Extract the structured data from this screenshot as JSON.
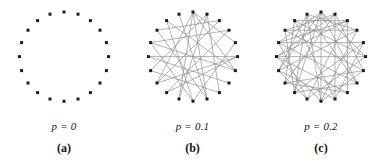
{
  "figure": {
    "type": "network-graph-series",
    "background_color": "#ffffff",
    "node_color": "#1c1c1c",
    "edge_color": "#8a8a8a"
  },
  "chart_data": {
    "type": "scatter",
    "title": "",
    "xlabel": "",
    "ylabel": "",
    "grid": false,
    "legend": null,
    "panels": [
      {
        "id": "a",
        "letter": "(a)",
        "param_label": "p = 0",
        "p_value": 0,
        "node_count": 20,
        "edge_count": 0,
        "layout": "ring",
        "center": [
          60,
          57
        ],
        "radius": 45,
        "nodes": [
          [
            60.0,
            12.0
          ],
          [
            74.0,
            14.2
          ],
          [
            86.4,
            20.6
          ],
          [
            96.0,
            30.2
          ],
          [
            102.4,
            42.6
          ],
          [
            104.6,
            56.6
          ],
          [
            102.4,
            70.6
          ],
          [
            96.0,
            83.0
          ],
          [
            86.4,
            92.6
          ],
          [
            74.0,
            99.0
          ],
          [
            60.0,
            101.2
          ],
          [
            46.0,
            99.0
          ],
          [
            33.6,
            92.6
          ],
          [
            24.0,
            83.0
          ],
          [
            17.6,
            70.6
          ],
          [
            15.4,
            56.6
          ],
          [
            17.6,
            42.6
          ],
          [
            24.0,
            30.2
          ],
          [
            33.6,
            20.6
          ],
          [
            46.0,
            14.2
          ]
        ],
        "edges": []
      },
      {
        "id": "b",
        "letter": "(b)",
        "param_label": "p = 0.1",
        "p_value": 0.1,
        "node_count": 20,
        "edge_count": 24,
        "layout": "ring-rewired",
        "center": [
          60,
          57
        ],
        "radius": 45,
        "nodes": [
          [
            60.0,
            12.0
          ],
          [
            74.0,
            14.2
          ],
          [
            86.4,
            20.6
          ],
          [
            96.0,
            30.2
          ],
          [
            102.4,
            42.6
          ],
          [
            104.6,
            56.6
          ],
          [
            102.4,
            70.6
          ],
          [
            96.0,
            83.0
          ],
          [
            86.4,
            92.6
          ],
          [
            74.0,
            99.0
          ],
          [
            60.0,
            101.2
          ],
          [
            46.0,
            99.0
          ],
          [
            33.6,
            92.6
          ],
          [
            24.0,
            83.0
          ],
          [
            17.6,
            70.6
          ],
          [
            15.4,
            56.6
          ],
          [
            17.6,
            42.6
          ],
          [
            24.0,
            30.2
          ],
          [
            33.6,
            20.6
          ],
          [
            46.0,
            14.2
          ]
        ],
        "edges": [
          [
            0,
            6
          ],
          [
            0,
            9
          ],
          [
            0,
            11
          ],
          [
            0,
            13
          ],
          [
            0,
            4
          ],
          [
            1,
            8
          ],
          [
            1,
            14
          ],
          [
            2,
            17
          ],
          [
            3,
            12
          ],
          [
            3,
            16
          ],
          [
            4,
            10
          ],
          [
            5,
            15
          ],
          [
            5,
            13
          ],
          [
            6,
            16
          ],
          [
            6,
            18
          ],
          [
            7,
            15
          ],
          [
            8,
            14
          ],
          [
            9,
            19
          ],
          [
            10,
            16
          ],
          [
            11,
            1
          ],
          [
            12,
            5
          ],
          [
            13,
            2
          ],
          [
            17,
            9
          ],
          [
            18,
            10
          ]
        ]
      },
      {
        "id": "c",
        "letter": "(c)",
        "param_label": "p = 0.2",
        "p_value": 0.2,
        "node_count": 20,
        "edge_count": 44,
        "layout": "ring-rewired",
        "center": [
          60,
          57
        ],
        "radius": 45,
        "nodes": [
          [
            60.0,
            12.0
          ],
          [
            74.0,
            14.2
          ],
          [
            86.4,
            20.6
          ],
          [
            96.0,
            30.2
          ],
          [
            102.4,
            42.6
          ],
          [
            104.6,
            56.6
          ],
          [
            102.4,
            70.6
          ],
          [
            96.0,
            83.0
          ],
          [
            86.4,
            92.6
          ],
          [
            74.0,
            99.0
          ],
          [
            60.0,
            101.2
          ],
          [
            46.0,
            99.0
          ],
          [
            33.6,
            92.6
          ],
          [
            24.0,
            83.0
          ],
          [
            17.6,
            70.6
          ],
          [
            15.4,
            56.6
          ],
          [
            17.6,
            42.6
          ],
          [
            24.0,
            30.2
          ],
          [
            33.6,
            20.6
          ],
          [
            46.0,
            14.2
          ]
        ],
        "edges": [
          [
            0,
            5
          ],
          [
            0,
            7
          ],
          [
            0,
            10
          ],
          [
            0,
            12
          ],
          [
            0,
            14
          ],
          [
            0,
            16
          ],
          [
            1,
            6
          ],
          [
            1,
            9
          ],
          [
            1,
            13
          ],
          [
            1,
            17
          ],
          [
            2,
            8
          ],
          [
            2,
            11
          ],
          [
            2,
            15
          ],
          [
            2,
            18
          ],
          [
            3,
            10
          ],
          [
            3,
            14
          ],
          [
            3,
            19
          ],
          [
            4,
            9
          ],
          [
            4,
            12
          ],
          [
            4,
            16
          ],
          [
            5,
            11
          ],
          [
            5,
            15
          ],
          [
            5,
            18
          ],
          [
            6,
            10
          ],
          [
            6,
            13
          ],
          [
            6,
            17
          ],
          [
            7,
            12
          ],
          [
            7,
            16
          ],
          [
            7,
            19
          ],
          [
            8,
            13
          ],
          [
            8,
            15
          ],
          [
            9,
            14
          ],
          [
            9,
            18
          ],
          [
            10,
            15
          ],
          [
            10,
            19
          ],
          [
            11,
            16
          ],
          [
            11,
            14
          ],
          [
            12,
            17
          ],
          [
            12,
            19
          ],
          [
            13,
            18
          ],
          [
            14,
            19
          ],
          [
            15,
            1
          ],
          [
            16,
            2
          ],
          [
            17,
            3
          ]
        ]
      }
    ]
  }
}
